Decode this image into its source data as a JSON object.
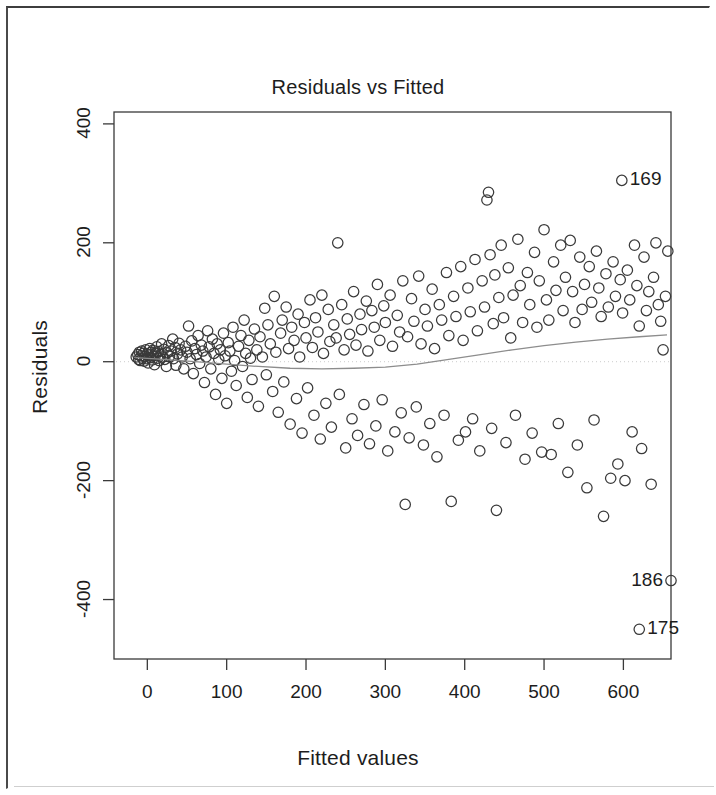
{
  "figure": {
    "kind": "r-diagnostic-plot",
    "stroke_color": "#3a3a3a",
    "text_color": "#1d1d1d",
    "curve_color": "#8d8d8d",
    "background": "#ffffff"
  },
  "chart_data": {
    "type": "scatter",
    "title": "Residuals vs Fitted",
    "xlabel": "Fitted values",
    "ylabel": "Residuals",
    "xlim": [
      -42,
      660
    ],
    "ylim": [
      -500,
      420
    ],
    "xticks": [
      0,
      100,
      200,
      300,
      400,
      500,
      600
    ],
    "xtick_labels": [
      "0",
      "100",
      "200",
      "300",
      "400",
      "500",
      "600"
    ],
    "yticks": [
      400,
      200,
      0,
      -200,
      -400
    ],
    "ytick_labels": [
      "400",
      "200",
      "0",
      "-200",
      "-400"
    ],
    "grid": false,
    "legend": null,
    "marker": "open-circle",
    "marker_size": 11,
    "annotations": [
      {
        "label": "169",
        "x": 598,
        "y": 305,
        "side": "right"
      },
      {
        "label": "186",
        "x": 660,
        "y": -368,
        "side": "left"
      },
      {
        "label": "175",
        "x": 620,
        "y": -450,
        "side": "right"
      }
    ],
    "smoother": {
      "name": "lowess",
      "x": [
        -15,
        20,
        60,
        100,
        140,
        180,
        220,
        260,
        300,
        340,
        380,
        420,
        460,
        500,
        540,
        580,
        620,
        655
      ],
      "y": [
        7,
        4,
        0,
        -4,
        -8,
        -11,
        -12,
        -11,
        -9,
        -4,
        4,
        12,
        20,
        27,
        33,
        38,
        42,
        45
      ]
    },
    "points": [
      [
        -14,
        8
      ],
      [
        -12,
        12
      ],
      [
        -11,
        4
      ],
      [
        -10,
        16
      ],
      [
        -9,
        2
      ],
      [
        -8,
        10
      ],
      [
        -7,
        18
      ],
      [
        -6,
        6
      ],
      [
        -5,
        14
      ],
      [
        -4,
        1
      ],
      [
        -3,
        9
      ],
      [
        -2,
        20
      ],
      [
        -1,
        5
      ],
      [
        0,
        13
      ],
      [
        1,
        -2
      ],
      [
        2,
        11
      ],
      [
        3,
        22
      ],
      [
        4,
        7
      ],
      [
        5,
        16
      ],
      [
        6,
        3
      ],
      [
        7,
        19
      ],
      [
        8,
        10
      ],
      [
        9,
        -5
      ],
      [
        10,
        14
      ],
      [
        12,
        25
      ],
      [
        13,
        6
      ],
      [
        14,
        17
      ],
      [
        15,
        2
      ],
      [
        17,
        12
      ],
      [
        18,
        30
      ],
      [
        19,
        8
      ],
      [
        21,
        21
      ],
      [
        22,
        4
      ],
      [
        24,
        -8
      ],
      [
        25,
        15
      ],
      [
        27,
        27
      ],
      [
        28,
        9
      ],
      [
        30,
        18
      ],
      [
        32,
        38
      ],
      [
        33,
        5
      ],
      [
        35,
        24
      ],
      [
        36,
        -6
      ],
      [
        38,
        13
      ],
      [
        40,
        31
      ],
      [
        42,
        20
      ],
      [
        44,
        8
      ],
      [
        46,
        -12
      ],
      [
        48,
        26
      ],
      [
        50,
        16
      ],
      [
        52,
        60
      ],
      [
        54,
        5
      ],
      [
        56,
        35
      ],
      [
        58,
        -20
      ],
      [
        60,
        22
      ],
      [
        62,
        12
      ],
      [
        64,
        44
      ],
      [
        66,
        -3
      ],
      [
        68,
        28
      ],
      [
        70,
        18
      ],
      [
        72,
        -35
      ],
      [
        74,
        8
      ],
      [
        76,
        52
      ],
      [
        78,
        25
      ],
      [
        80,
        -12
      ],
      [
        82,
        38
      ],
      [
        84,
        14
      ],
      [
        86,
        -55
      ],
      [
        88,
        30
      ],
      [
        90,
        4
      ],
      [
        92,
        20
      ],
      [
        94,
        -28
      ],
      [
        96,
        48
      ],
      [
        98,
        10
      ],
      [
        100,
        -70
      ],
      [
        102,
        32
      ],
      [
        104,
        18
      ],
      [
        106,
        -16
      ],
      [
        108,
        58
      ],
      [
        110,
        2
      ],
      [
        112,
        -40
      ],
      [
        115,
        26
      ],
      [
        118,
        44
      ],
      [
        120,
        -8
      ],
      [
        122,
        70
      ],
      [
        124,
        14
      ],
      [
        126,
        -60
      ],
      [
        128,
        36
      ],
      [
        130,
        6
      ],
      [
        132,
        -30
      ],
      [
        135,
        55
      ],
      [
        138,
        20
      ],
      [
        140,
        -75
      ],
      [
        142,
        42
      ],
      [
        145,
        8
      ],
      [
        148,
        90
      ],
      [
        150,
        -22
      ],
      [
        152,
        62
      ],
      [
        155,
        30
      ],
      [
        158,
        -50
      ],
      [
        160,
        110
      ],
      [
        162,
        16
      ],
      [
        165,
        -85
      ],
      [
        168,
        48
      ],
      [
        170,
        70
      ],
      [
        172,
        -34
      ],
      [
        175,
        92
      ],
      [
        178,
        22
      ],
      [
        180,
        -105
      ],
      [
        182,
        58
      ],
      [
        185,
        36
      ],
      [
        188,
        -62
      ],
      [
        190,
        80
      ],
      [
        192,
        8
      ],
      [
        195,
        -120
      ],
      [
        198,
        66
      ],
      [
        200,
        40
      ],
      [
        202,
        -44
      ],
      [
        205,
        104
      ],
      [
        208,
        24
      ],
      [
        210,
        -90
      ],
      [
        212,
        74
      ],
      [
        215,
        50
      ],
      [
        218,
        -130
      ],
      [
        220,
        112
      ],
      [
        222,
        14
      ],
      [
        225,
        -70
      ],
      [
        228,
        88
      ],
      [
        230,
        34
      ],
      [
        232,
        -110
      ],
      [
        235,
        62
      ],
      [
        238,
        40
      ],
      [
        240,
        200
      ],
      [
        242,
        -55
      ],
      [
        245,
        96
      ],
      [
        248,
        20
      ],
      [
        250,
        -145
      ],
      [
        252,
        72
      ],
      [
        255,
        46
      ],
      [
        258,
        -96
      ],
      [
        260,
        118
      ],
      [
        263,
        28
      ],
      [
        265,
        -124
      ],
      [
        268,
        80
      ],
      [
        270,
        54
      ],
      [
        273,
        -72
      ],
      [
        276,
        102
      ],
      [
        278,
        18
      ],
      [
        280,
        -138
      ],
      [
        283,
        86
      ],
      [
        286,
        58
      ],
      [
        288,
        -108
      ],
      [
        290,
        130
      ],
      [
        293,
        36
      ],
      [
        296,
        -64
      ],
      [
        298,
        94
      ],
      [
        300,
        66
      ],
      [
        303,
        -150
      ],
      [
        306,
        112
      ],
      [
        309,
        26
      ],
      [
        312,
        -118
      ],
      [
        315,
        78
      ],
      [
        318,
        50
      ],
      [
        320,
        -86
      ],
      [
        322,
        136
      ],
      [
        325,
        -240
      ],
      [
        328,
        42
      ],
      [
        330,
        -128
      ],
      [
        333,
        106
      ],
      [
        336,
        68
      ],
      [
        339,
        -76
      ],
      [
        342,
        144
      ],
      [
        345,
        30
      ],
      [
        348,
        -140
      ],
      [
        350,
        88
      ],
      [
        353,
        60
      ],
      [
        356,
        -104
      ],
      [
        359,
        122
      ],
      [
        362,
        22
      ],
      [
        365,
        -160
      ],
      [
        368,
        96
      ],
      [
        371,
        70
      ],
      [
        374,
        -90
      ],
      [
        377,
        150
      ],
      [
        380,
        44
      ],
      [
        383,
        -235
      ],
      [
        386,
        110
      ],
      [
        389,
        76
      ],
      [
        392,
        -132
      ],
      [
        395,
        160
      ],
      [
        398,
        36
      ],
      [
        401,
        -118
      ],
      [
        404,
        124
      ],
      [
        407,
        84
      ],
      [
        410,
        -96
      ],
      [
        413,
        172
      ],
      [
        416,
        52
      ],
      [
        419,
        -150
      ],
      [
        422,
        136
      ],
      [
        425,
        92
      ],
      [
        428,
        272
      ],
      [
        430,
        285
      ],
      [
        432,
        180
      ],
      [
        434,
        -112
      ],
      [
        436,
        64
      ],
      [
        438,
        146
      ],
      [
        440,
        -250
      ],
      [
        443,
        108
      ],
      [
        446,
        196
      ],
      [
        449,
        74
      ],
      [
        452,
        -136
      ],
      [
        455,
        158
      ],
      [
        458,
        40
      ],
      [
        461,
        112
      ],
      [
        464,
        -90
      ],
      [
        467,
        206
      ],
      [
        470,
        128
      ],
      [
        473,
        66
      ],
      [
        476,
        -164
      ],
      [
        479,
        150
      ],
      [
        482,
        96
      ],
      [
        485,
        -120
      ],
      [
        488,
        184
      ],
      [
        491,
        58
      ],
      [
        494,
        136
      ],
      [
        497,
        -152
      ],
      [
        500,
        222
      ],
      [
        503,
        104
      ],
      [
        506,
        70
      ],
      [
        509,
        -156
      ],
      [
        512,
        168
      ],
      [
        515,
        120
      ],
      [
        518,
        -104
      ],
      [
        521,
        196
      ],
      [
        524,
        86
      ],
      [
        527,
        142
      ],
      [
        530,
        -186
      ],
      [
        533,
        204
      ],
      [
        536,
        118
      ],
      [
        539,
        66
      ],
      [
        542,
        -140
      ],
      [
        545,
        176
      ],
      [
        548,
        88
      ],
      [
        551,
        130
      ],
      [
        554,
        -212
      ],
      [
        557,
        160
      ],
      [
        560,
        100
      ],
      [
        563,
        -98
      ],
      [
        566,
        186
      ],
      [
        569,
        124
      ],
      [
        572,
        76
      ],
      [
        575,
        -260
      ],
      [
        578,
        148
      ],
      [
        581,
        92
      ],
      [
        584,
        -196
      ],
      [
        587,
        168
      ],
      [
        590,
        110
      ],
      [
        593,
        -172
      ],
      [
        596,
        138
      ],
      [
        599,
        82
      ],
      [
        602,
        -200
      ],
      [
        605,
        154
      ],
      [
        608,
        104
      ],
      [
        611,
        -118
      ],
      [
        614,
        196
      ],
      [
        617,
        128
      ],
      [
        620,
        60
      ],
      [
        623,
        -146
      ],
      [
        626,
        176
      ],
      [
        629,
        86
      ],
      [
        632,
        118
      ],
      [
        635,
        -206
      ],
      [
        638,
        142
      ],
      [
        641,
        200
      ],
      [
        644,
        96
      ],
      [
        647,
        68
      ],
      [
        650,
        20
      ],
      [
        653,
        110
      ],
      [
        656,
        186
      ],
      [
        598,
        305
      ],
      [
        660,
        -368
      ],
      [
        620,
        -450
      ]
    ]
  }
}
